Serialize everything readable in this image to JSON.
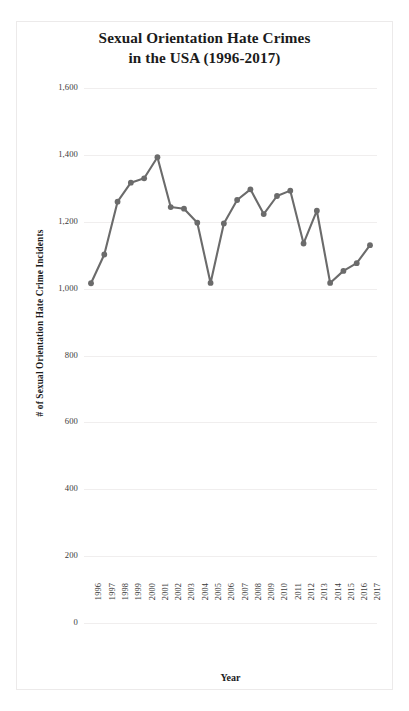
{
  "chart_data": {
    "type": "line",
    "title": "Sexual Orientation Hate Crimes in the USA (1996-2017)",
    "title_lines": [
      "Sexual Orientation Hate Crimes",
      "in the USA (1996-2017)"
    ],
    "xlabel": "Year",
    "ylabel": "# of Sexual Orientation Hate Crime Incidents",
    "ylim": [
      0,
      1600
    ],
    "ytick_labels": [
      "1,600",
      "1,400",
      "1,200",
      "1,000",
      "800",
      "600",
      "400",
      "200",
      "0"
    ],
    "ytick_values": [
      1600,
      1400,
      1200,
      1000,
      800,
      600,
      400,
      200,
      0
    ],
    "grid": true,
    "legend": "none",
    "categories": [
      "1996",
      "1997",
      "1998",
      "1999",
      "2000",
      "2001",
      "2002",
      "2003",
      "2004",
      "2005",
      "2006",
      "2007",
      "2008",
      "2009",
      "2010",
      "2011",
      "2012",
      "2013",
      "2014",
      "2015",
      "2016",
      "2017"
    ],
    "values": [
      1016,
      1102,
      1260,
      1317,
      1330,
      1393,
      1244,
      1239,
      1197,
      1017,
      1195,
      1265,
      1297,
      1223,
      1277,
      1293,
      1135,
      1233,
      1017,
      1053,
      1076,
      1130
    ],
    "series": [
      {
        "name": "# of Sexual Orientation Hate Crime Incidents",
        "color": "#6b6b6b",
        "marker": "circle",
        "values": [
          1016,
          1102,
          1260,
          1317,
          1330,
          1393,
          1244,
          1239,
          1197,
          1017,
          1195,
          1265,
          1297,
          1223,
          1277,
          1293,
          1135,
          1233,
          1017,
          1053,
          1076,
          1130
        ]
      }
    ]
  },
  "colors": {
    "line": "#6b6b6b",
    "marker": "#6b6b6b",
    "grid": "#f0eeee",
    "text": "#1b1b1b",
    "tick_text": "#3a3a3a",
    "panel_border": "#eceaea",
    "background": "#ffffff"
  }
}
